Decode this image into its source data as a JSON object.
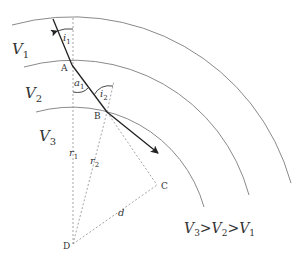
{
  "diagram": {
    "title": "",
    "layers": [
      {
        "label": "V",
        "sub": "1"
      },
      {
        "label": "V",
        "sub": "2"
      },
      {
        "label": "V",
        "sub": "3"
      }
    ],
    "points": {
      "A": "A",
      "B": "B",
      "C": "C",
      "D": "D"
    },
    "angles": {
      "i1": {
        "label": "i",
        "sub": "1"
      },
      "a1": {
        "label": "a",
        "sub": "1"
      },
      "i2": {
        "label": "i",
        "sub": "2"
      }
    },
    "segments": {
      "r1": {
        "label": "r",
        "sub": "1"
      },
      "r2": {
        "label": "r",
        "sub": "2"
      },
      "d": {
        "label": "d"
      }
    },
    "relation": {
      "v3": "V",
      "v3_sub": "3",
      "gt1": ">",
      "v2": "V",
      "v2_sub": "2",
      "gt2": ">",
      "v1": "V",
      "v1_sub": "1"
    },
    "colors": {
      "arc": "#8a8a8a",
      "ray": "#222222",
      "dashed": "#9a9a9a",
      "text": "#333333"
    }
  }
}
